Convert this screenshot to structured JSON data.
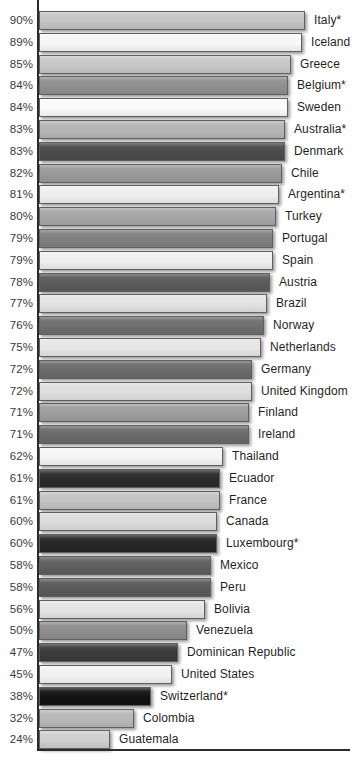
{
  "chart_data": {
    "type": "bar",
    "orientation": "horizontal",
    "title": "",
    "subtitle": "",
    "xlabel": "",
    "ylabel": "",
    "xlim": [
      0,
      100
    ],
    "grid": false,
    "legend": null,
    "value_suffix": "%",
    "axis_color": "#2b2b2b",
    "bar_border_color": "#5f5f5f",
    "categories": [
      "Italy*",
      "Iceland",
      "Greece",
      "Belgium*",
      "Sweden",
      "Australia*",
      "Denmark",
      "Chile",
      "Argentina*",
      "Turkey",
      "Portugal",
      "Spain",
      "Austria",
      "Brazil",
      "Norway",
      "Netherlands",
      "Germany",
      "United Kingdom",
      "Finland",
      "Ireland",
      "Thailand",
      "Ecuador",
      "France",
      "Canada",
      "Luxembourg*",
      "Mexico",
      "Peru",
      "Bolivia",
      "Venezuela",
      "Dominican Republic",
      "United States",
      "Switzerland*",
      "Colombia",
      "Guatemala"
    ],
    "values": [
      90,
      89,
      85,
      84,
      84,
      83,
      83,
      82,
      81,
      80,
      79,
      79,
      78,
      77,
      76,
      75,
      72,
      72,
      71,
      71,
      62,
      61,
      61,
      60,
      60,
      58,
      58,
      56,
      50,
      47,
      45,
      38,
      32,
      24
    ],
    "tick_labels": [
      "90%",
      "89%",
      "85%",
      "84%",
      "84%",
      "83%",
      "83%",
      "82%",
      "81%",
      "80%",
      "79%",
      "79%",
      "78%",
      "77%",
      "76%",
      "75%",
      "72%",
      "72%",
      "71%",
      "71%",
      "62%",
      "61%",
      "61%",
      "60%",
      "60%",
      "58%",
      "58%",
      "56%",
      "50%",
      "47%",
      "45%",
      "38%",
      "32%",
      "24%"
    ],
    "bar_colors": [
      "#c4c4c4",
      "#f7f7f7",
      "#c8c8c8",
      "#8f8f8f",
      "#fbfbfb",
      "#b5b5b5",
      "#4a4a4a",
      "#9a9a9a",
      "#efefef",
      "#a6a6a6",
      "#808080",
      "#efefef",
      "#5a5a5a",
      "#e2e2e2",
      "#6e6e6e",
      "#e6e6e6",
      "#6b6b6b",
      "#dedede",
      "#9e9e9e",
      "#6a6a6a",
      "#f5f5f5",
      "#2a2a2a",
      "#c2c2c2",
      "#dcdcdc",
      "#262626",
      "#5e5e5e",
      "#5a5a5a",
      "#e4e4e4",
      "#8d8d8d",
      "#3a3a3a",
      "#f2f2f2",
      "#121212",
      "#b8b8b8",
      "#cfcfcf"
    ]
  }
}
